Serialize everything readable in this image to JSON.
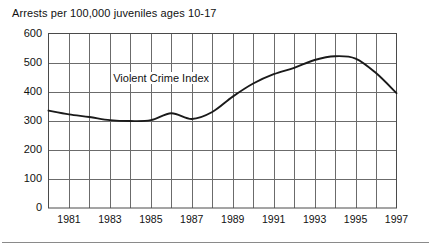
{
  "chart_title": "Arrests per 100,000 juveniles ages 10-17",
  "series_annotation": "Violent Crime Index",
  "axis": {
    "y_ticks": [
      "0",
      "100",
      "200",
      "300",
      "400",
      "500",
      "600"
    ],
    "x_ticks": [
      "1981",
      "1983",
      "1985",
      "1987",
      "1989",
      "1991",
      "1993",
      "1995",
      "1997"
    ]
  },
  "colors": {
    "line": "#1a1a1a",
    "grid": "#6b6b6b",
    "frame": "#4a4a4a",
    "rule": "#8a8a8a",
    "text": "#111111",
    "background": "#ffffff"
  },
  "chart_data": {
    "type": "line",
    "title": "Arrests per 100,000 juveniles ages 10-17",
    "subtitle": "",
    "xlabel": "",
    "ylabel": "Arrests per 100,000 juveniles ages 10-17",
    "xlim": [
      1980,
      1997
    ],
    "ylim": [
      0,
      600
    ],
    "ytick_values": [
      0,
      100,
      200,
      300,
      400,
      500,
      600
    ],
    "xtick_values": [
      1981,
      1983,
      1985,
      1987,
      1989,
      1991,
      1993,
      1995,
      1997
    ],
    "grid": true,
    "grid_x_every": 1,
    "legend": "inline-annotation",
    "legend_position": "inside-upper-left-of-curve",
    "annotations": [
      {
        "text": "Violent Crime Index",
        "x": 1985.8,
        "y": 448
      }
    ],
    "series": [
      {
        "name": "Violent Crime Index",
        "x": [
          1980,
          1981,
          1982,
          1983,
          1984,
          1985,
          1986,
          1987,
          1988,
          1989,
          1990,
          1991,
          1992,
          1993,
          1994,
          1995,
          1996,
          1997
        ],
        "values": [
          335,
          322,
          313,
          302,
          299,
          302,
          326,
          306,
          330,
          383,
          428,
          460,
          482,
          509,
          522,
          514,
          464,
          395
        ]
      }
    ]
  }
}
